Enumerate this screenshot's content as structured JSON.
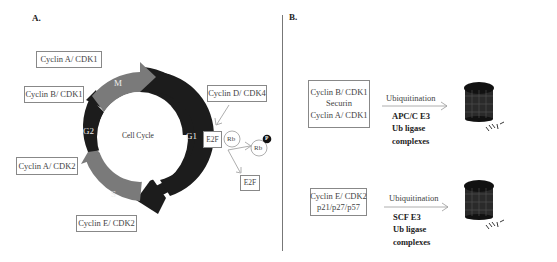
{
  "panel_a": {
    "label": "A.",
    "center_label": "Cell Cycle",
    "phases": [
      {
        "name": "M",
        "color": "#7a7a7a"
      },
      {
        "name": "G1",
        "color": "#1e1e1e"
      },
      {
        "name": "S",
        "color": "#7a7a7a"
      },
      {
        "name": "G2",
        "color": "#1e1e1e"
      }
    ],
    "complexes": {
      "cyclin_a_cdk1": "Cyclin A/ CDK1",
      "cyclin_b_cdk1": "Cyclin B/ CDK1",
      "cyclin_a_cdk2": "Cyclin A/ CDK2",
      "cyclin_e_cdk2": "Cyclin E/ CDK2",
      "cyclin_d_cdk4": "Cyclin D/ CDK4"
    },
    "rb_pathway": {
      "e2f_bound": "E2F",
      "rb_bound": "Rb",
      "rb_phosphorylated": "Rb",
      "phosphate": "P",
      "e2f_free": "E2F"
    }
  },
  "panel_b": {
    "label": "B.",
    "rows": [
      {
        "substrates": [
          "Cyclin B/ CDK1",
          "Securin",
          "Cyclin A/ CDK1"
        ],
        "process": "Ubiquitination",
        "ligase": [
          "APC/C E3",
          "Ub ligase",
          "complexes"
        ]
      },
      {
        "substrates": [
          "Cyclin E/ CDK2",
          "p21/p27/p57"
        ],
        "process": "Ubiquitination",
        "ligase": [
          "SCF E3",
          "Ub ligase",
          "complexes"
        ]
      }
    ]
  }
}
